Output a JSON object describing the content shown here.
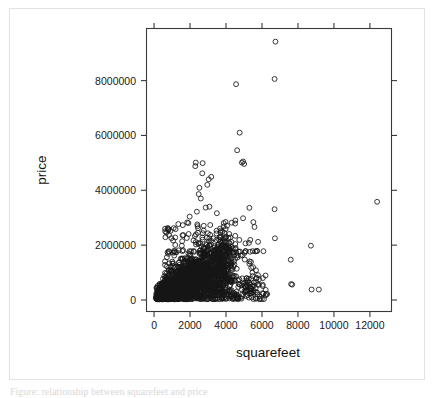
{
  "figure": {
    "background_color": "#ffffff",
    "border_color": "#e2e2e2",
    "point_color": "#151515",
    "axis_color": "#3a3a3a",
    "caption_partial": "Figure: relationship between squarefeet and price"
  },
  "chart_data": {
    "type": "scatter",
    "title": "",
    "xlabel": "squarefeet",
    "ylabel": "price",
    "xlim": [
      -420,
      13200
    ],
    "ylim": [
      -420000,
      9900000
    ],
    "grid": false,
    "legend": "none",
    "marker": "open-circle",
    "xticks": [
      0,
      2000,
      4000,
      6000,
      8000,
      10000,
      12000
    ],
    "xtick_labels": [
      "0",
      "2000",
      "4000",
      "6000",
      "8000",
      "10000",
      "12000"
    ],
    "yticks": [
      0,
      2000000,
      4000000,
      6000000,
      8000000
    ],
    "ytick_labels": [
      "0",
      "2000000",
      "4000000",
      "6000000",
      "8000000"
    ],
    "ticks_on_all_sides": true,
    "n_points_approx": 2100,
    "outliers": [
      {
        "x": 6750,
        "y": 9420000
      },
      {
        "x": 6700,
        "y": 8060000
      },
      {
        "x": 4560,
        "y": 7870000
      },
      {
        "x": 4760,
        "y": 6100000
      },
      {
        "x": 4620,
        "y": 5460000
      },
      {
        "x": 4950,
        "y": 5050000
      },
      {
        "x": 4880,
        "y": 5010000
      },
      {
        "x": 5010,
        "y": 4960000
      },
      {
        "x": 2320,
        "y": 5010000
      },
      {
        "x": 2290,
        "y": 4880000
      },
      {
        "x": 2700,
        "y": 4990000
      },
      {
        "x": 2680,
        "y": 4620000
      },
      {
        "x": 3180,
        "y": 4490000
      },
      {
        "x": 3040,
        "y": 4400000
      },
      {
        "x": 2960,
        "y": 4200000
      },
      {
        "x": 2520,
        "y": 4090000
      },
      {
        "x": 2480,
        "y": 3860000
      },
      {
        "x": 2600,
        "y": 3700000
      },
      {
        "x": 12400,
        "y": 3580000
      },
      {
        "x": 5300,
        "y": 3360000
      },
      {
        "x": 6700,
        "y": 3310000
      },
      {
        "x": 3080,
        "y": 3400000
      },
      {
        "x": 2870,
        "y": 3370000
      },
      {
        "x": 2380,
        "y": 3220000
      },
      {
        "x": 1980,
        "y": 3040000
      },
      {
        "x": 5520,
        "y": 2840000
      },
      {
        "x": 6720,
        "y": 2250000
      },
      {
        "x": 5350,
        "y": 2190000
      },
      {
        "x": 4740,
        "y": 2190000
      },
      {
        "x": 8720,
        "y": 1980000
      },
      {
        "x": 7600,
        "y": 1470000
      },
      {
        "x": 6080,
        "y": 1780000
      },
      {
        "x": 5720,
        "y": 1790000
      },
      {
        "x": 5640,
        "y": 1770000
      },
      {
        "x": 5340,
        "y": 1760000
      },
      {
        "x": 4700,
        "y": 1760000
      },
      {
        "x": 7620,
        "y": 580000
      },
      {
        "x": 7680,
        "y": 560000
      },
      {
        "x": 8760,
        "y": 380000
      },
      {
        "x": 9160,
        "y": 380000
      },
      {
        "x": 6050,
        "y": 800000
      },
      {
        "x": 5750,
        "y": 560000
      },
      {
        "x": 5880,
        "y": 130000
      },
      {
        "x": 5350,
        "y": 330000
      },
      {
        "x": 5060,
        "y": 280000
      },
      {
        "x": 4460,
        "y": 240000
      },
      {
        "x": 4180,
        "y": 180000
      }
    ],
    "cluster": {
      "description": "dense mass of open circles",
      "x_center": 1750,
      "y_center": 650000,
      "x_spread": 900,
      "y_spread": 520000
    },
    "data_source_note": ""
  },
  "axis_titles": {
    "x": "squarefeet",
    "y": "price"
  }
}
